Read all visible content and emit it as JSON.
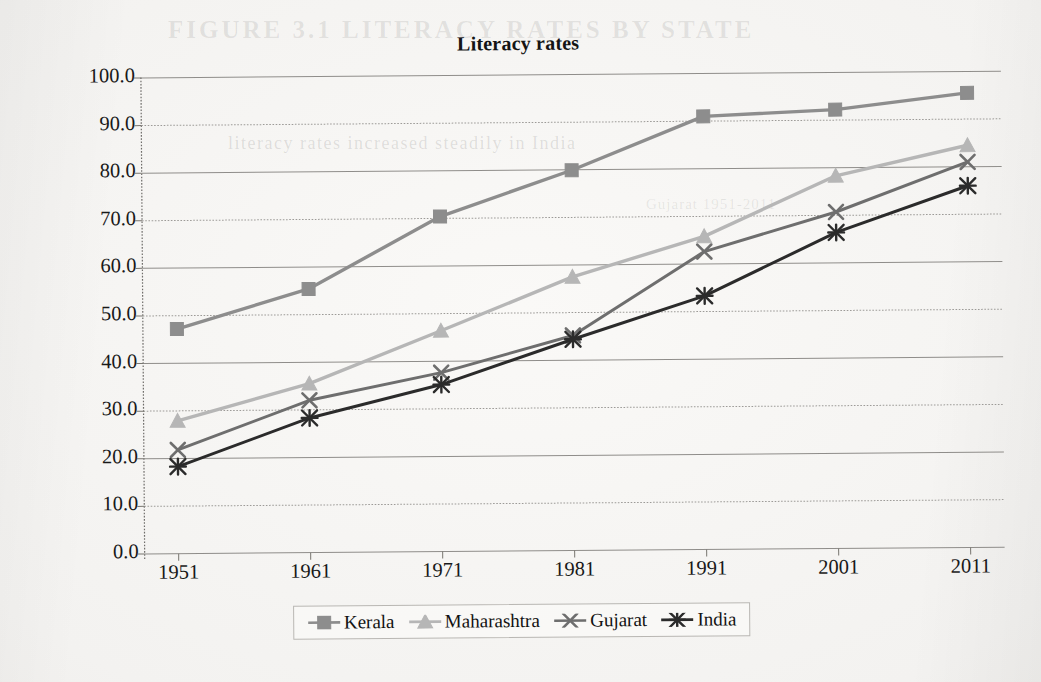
{
  "page": {
    "ghost_text_top": "FIGURE 3.1 LITERACY RATES BY STATE",
    "ghost_text_sub": "literacy rates increased steadily in India",
    "ghost_text_small": "Gujarat 1951-2011"
  },
  "chart_data": {
    "type": "line",
    "title": "Literacy rates",
    "xlabel": "",
    "ylabel": "",
    "categories": [
      "1951",
      "1961",
      "1971",
      "1981",
      "1991",
      "2001",
      "2011"
    ],
    "ylim": [
      0,
      100
    ],
    "yticks": [
      "0.0",
      "10.0",
      "20.0",
      "30.0",
      "40.0",
      "50.0",
      "60.0",
      "70.0",
      "80.0",
      "90.0",
      "100.0"
    ],
    "ytick_values": [
      0,
      10,
      20,
      30,
      40,
      50,
      60,
      70,
      80,
      90,
      100
    ],
    "grid": true,
    "legend_position": "bottom",
    "series": [
      {
        "name": "Kerala",
        "marker": "square",
        "color": "#8d8d8d",
        "values": [
          47.2,
          55.4,
          70.4,
          79.9,
          91.0,
          92.2,
          95.5
        ]
      },
      {
        "name": "Maharashtra",
        "marker": "triangle",
        "color": "#b6b6b6",
        "values": [
          27.9,
          35.5,
          46.4,
          57.5,
          65.8,
          78.3,
          84.5
        ]
      },
      {
        "name": "Gujarat",
        "marker": "x-cross",
        "color": "#6e6e6e",
        "values": [
          21.8,
          32.0,
          37.6,
          45.2,
          62.6,
          70.7,
          81.0
        ]
      },
      {
        "name": "India",
        "marker": "asterisk",
        "color": "#2b2b2b",
        "values": [
          18.3,
          28.3,
          35.1,
          44.4,
          53.3,
          66.4,
          76.0
        ]
      }
    ]
  }
}
